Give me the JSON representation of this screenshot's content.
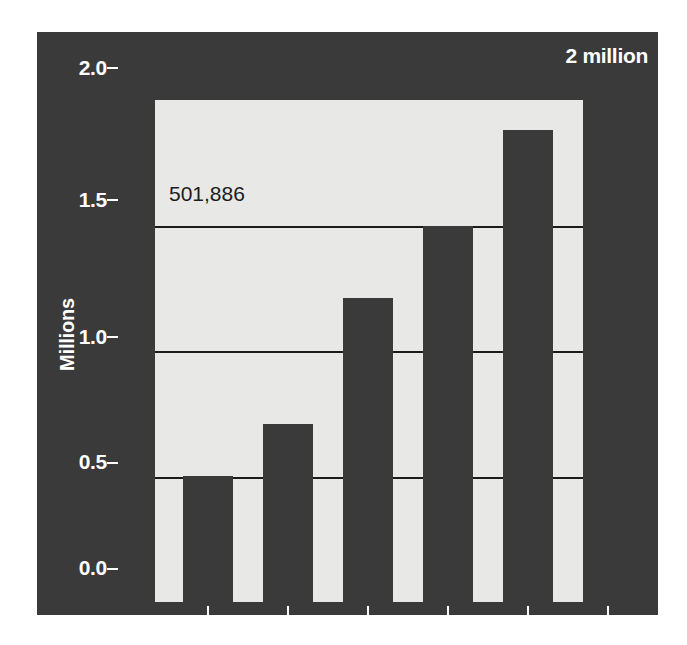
{
  "chart_data": {
    "type": "bar",
    "title": "",
    "subtitle": "",
    "xlabel": "",
    "ylabel": "Millions",
    "categories": [
      "1980",
      "1985",
      "1990",
      "1995",
      "2000",
      "2003"
    ],
    "values": [
      0.501886,
      0.71,
      1.21,
      1.5,
      1.88,
      2.0
    ],
    "ylim": [
      0.0,
      2.0
    ],
    "yticks": [
      "0.0",
      "0.5",
      "1.0",
      "1.5",
      "2.0"
    ],
    "ytick_values": [
      0.0,
      0.5,
      1.0,
      1.5,
      2.0
    ],
    "grid": true,
    "gridlines_at": [
      0.5,
      1.0,
      1.5
    ],
    "legend": "none",
    "annotations": [
      {
        "name": "first-bar-value",
        "text": "501,886",
        "series_index": 0
      },
      {
        "name": "top-right-note",
        "text": "2 million"
      }
    ],
    "colors": {
      "panel_background": "#3a3a3a",
      "plot_background": "#e8e8e6",
      "bar_fill": "#3a3a3a",
      "gridline": "#1c1c1c",
      "axis_text": "#ffffff",
      "value_label_text": "#1c1c1c"
    }
  },
  "axes": {
    "y": {
      "label": "Millions",
      "ticks": [
        {
          "label": "2.0",
          "value": 2.0
        },
        {
          "label": "1.5",
          "value": 1.5
        },
        {
          "label": "1.0",
          "value": 1.0
        },
        {
          "label": "0.5",
          "value": 0.5
        },
        {
          "label": "0.0",
          "value": 0.0
        }
      ]
    },
    "x": {
      "label": "",
      "ticks": [
        {
          "label": "1980"
        },
        {
          "label": "1985"
        },
        {
          "label": "1990"
        },
        {
          "label": "1995"
        },
        {
          "label": "2000"
        },
        {
          "label": "2003"
        }
      ]
    }
  },
  "annotations": {
    "corner_note": "2 million",
    "first_bar_value": "501,886"
  }
}
